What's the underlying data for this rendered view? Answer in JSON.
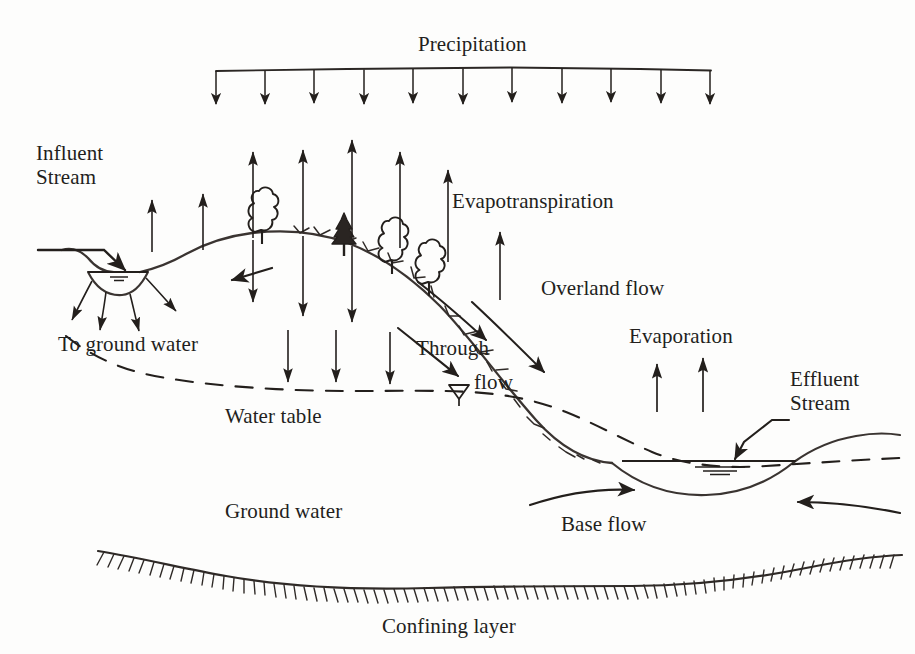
{
  "figure": {
    "kind": "hydrologic-cycle-cross-section",
    "title_visible": false,
    "ink_color": "#231f1c",
    "paper_color": "#fdfdfc"
  },
  "labels": {
    "precipitation": "Precipitation",
    "influent_stream_line1": "Influent",
    "influent_stream_line2": "Stream",
    "evapotranspiration": "Evapotranspiration",
    "to_ground_water": "To ground water",
    "overland_flow": "Overland flow",
    "evaporation": "Evaporation",
    "through_flow_line1": "Through",
    "through_flow_line2": "flow",
    "effluent_stream_line1": "Effluent",
    "effluent_stream_line2": "Stream",
    "water_table": "Water table",
    "ground_water": "Ground water",
    "base_flow": "Base flow",
    "confining_layer": "Confining layer"
  },
  "label_positions": {
    "precipitation": {
      "x": 418,
      "y": 33
    },
    "influent_stream": {
      "x": 36,
      "y": 142
    },
    "evapotranspiration": {
      "x": 452,
      "y": 190
    },
    "to_ground_water": {
      "x": 58,
      "y": 333
    },
    "overland_flow": {
      "x": 541,
      "y": 277
    },
    "evaporation": {
      "x": 629,
      "y": 325
    },
    "through_flow": {
      "x": 416,
      "y": 337
    },
    "effluent_stream": {
      "x": 790,
      "y": 368
    },
    "water_table": {
      "x": 225,
      "y": 405
    },
    "ground_water": {
      "x": 225,
      "y": 500
    },
    "base_flow": {
      "x": 561,
      "y": 513
    },
    "confining_layer": {
      "x": 382,
      "y": 615
    }
  },
  "precipitation_band": {
    "bar_left_x": 216,
    "bar_right_x": 711,
    "bar_y": 70,
    "arrow_count": 11,
    "arrow_tip_y": 108
  },
  "evapotranspiration_arrows": {
    "direction": "up",
    "count": 7,
    "x_positions": [
      203,
      253,
      303,
      352,
      400,
      448,
      497
    ],
    "base_y": [
      250,
      238,
      232,
      235,
      245,
      258,
      280
    ],
    "tip_y": [
      198,
      150,
      152,
      140,
      150,
      168,
      200
    ]
  },
  "infiltration_arrows": {
    "direction": "down",
    "count": 4,
    "x_positions": [
      290,
      340,
      388,
      325
    ],
    "note": "downward arrows from hill surface into soil"
  },
  "trees": {
    "deciduous_count": 4,
    "conifer_count": 1,
    "x_positions": [
      262,
      390,
      420,
      450,
      340
    ]
  },
  "streams": {
    "influent": {
      "type": "losing-stream",
      "channel_left_x": 88,
      "channel_right_x": 140,
      "water_surface_y": 272,
      "seepage_arrow_count": 4
    },
    "effluent": {
      "type": "gaining-stream",
      "water_surface_y": 460,
      "channel_left_x": 660,
      "channel_right_x": 800
    }
  },
  "flow_features": {
    "overland_flow_arrow_count": 1,
    "through_flow_arrow_count": 1,
    "base_flow_arrow_count": 2,
    "evaporation_arrow_count": 2,
    "to_ground_water_arrow_count": 4
  },
  "layers": [
    {
      "name": "land surface",
      "style": "solid-line-with-hachures"
    },
    {
      "name": "water table",
      "style": "dashed-line"
    },
    {
      "name": "ground water zone",
      "style": "unshaded"
    },
    {
      "name": "confining layer",
      "style": "solid-line-with-tick-hachures"
    }
  ]
}
